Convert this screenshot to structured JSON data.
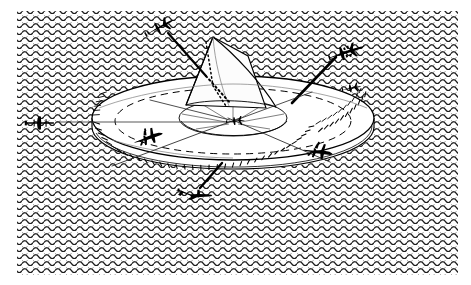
{
  "figure": {
    "kind": "technical-illustration",
    "width": 471,
    "height": 285,
    "background_style": "wavy-scalloped-hatch",
    "colors": {
      "paper": "#ffffff",
      "ink": "#000000",
      "hatch": "#2b2b2b",
      "hatch_tint": "#9a9a9a",
      "structure_fill": "#fdfdfd",
      "structure_light": "#f4f4f4"
    }
  },
  "frame": {
    "name": "hatched-background-panel",
    "x": 17,
    "y": 11,
    "width": 441,
    "height": 264,
    "pattern": "rows of scallop / wave marks"
  },
  "structure": {
    "name": "parabolic-dish-antenna",
    "parts": [
      {
        "id": "outer-rim-ellipse",
        "label": "Outer dish rim"
      },
      {
        "id": "dish-body-underside",
        "label": "Dish underside / torus body"
      },
      {
        "id": "rim-radial-ticks",
        "label": "Radial rib ticks along lower rim"
      },
      {
        "id": "inner-bowl-ellipse",
        "label": "Inner reflector bowl"
      },
      {
        "id": "inner-bowl-ribs",
        "label": "Inner bowl radial ribs"
      },
      {
        "id": "central-cone",
        "label": "Central feed cone / horn"
      },
      {
        "id": "dashed-horizon-ellipse",
        "label": "Dashed reference ellipse"
      },
      {
        "id": "cone-dotted-edge",
        "label": "Dotted cone edge line"
      }
    ],
    "center": {
      "x": 233,
      "y": 122
    }
  },
  "targets": [
    {
      "id": "aircraft-top-left",
      "label": "Aircraft — upper left bearing",
      "icon": "aircraft-top-view-icon",
      "x": 160,
      "y": 27,
      "rotation": -28,
      "scale": 1.0,
      "link": {
        "style": "solid-then-dotted",
        "to_x": 214,
        "to_y": 99
      }
    },
    {
      "id": "aircraft-upper-right",
      "label": "Aircraft — upper right bearing",
      "icon": "four-engine-bomber-icon",
      "x": 347,
      "y": 52,
      "rotation": -18,
      "scale": 1.1,
      "link": {
        "style": "solid-thick",
        "to_x": 290,
        "to_y": 103
      }
    },
    {
      "id": "aircraft-right-small",
      "label": "Aircraft — right flank",
      "icon": "small-aircraft-icon",
      "x": 352,
      "y": 88,
      "rotation": -10,
      "scale": 0.72,
      "link": null
    },
    {
      "id": "aircraft-left-head-on",
      "label": "Aircraft — left, head-on view",
      "icon": "aircraft-front-view-icon",
      "x": 42,
      "y": 123,
      "rotation": 0,
      "scale": 1.0,
      "link": {
        "style": "solid-thin",
        "to_x": 92,
        "to_y": 122
      }
    },
    {
      "id": "aircraft-rim-left",
      "label": "Aircraft — on left rim",
      "icon": "aircraft-silhouette-icon",
      "x": 148,
      "y": 137,
      "rotation": -14,
      "scale": 0.95,
      "link": null
    },
    {
      "id": "aircraft-rim-right",
      "label": "Aircraft — on right rim",
      "icon": "aircraft-silhouette-icon",
      "x": 318,
      "y": 151,
      "rotation": 12,
      "scale": 0.95,
      "link": null
    },
    {
      "id": "aircraft-center-bowl",
      "label": "Aircraft — at bowl centre",
      "icon": "small-aircraft-icon",
      "x": 236,
      "y": 121,
      "rotation": -6,
      "scale": 0.85,
      "link": null
    },
    {
      "id": "aircraft-bottom",
      "label": "Aircraft — lower bearing",
      "icon": "aircraft-banking-icon",
      "x": 195,
      "y": 196,
      "rotation": 14,
      "scale": 1.0,
      "link": {
        "style": "solid-thick",
        "to_x": 222,
        "to_y": 163
      }
    }
  ],
  "beams": [
    {
      "id": "beam-left",
      "label": "Beam axis to left target"
    },
    {
      "id": "beam-upper-right",
      "label": "Beam axis to upper right target"
    },
    {
      "id": "beam-lower-left",
      "label": "Beam axis to lower left"
    },
    {
      "id": "beam-lower-right",
      "label": "Beam axis to lower right"
    },
    {
      "id": "beam-top-left-dotted",
      "label": "Dotted beam axis to top left target"
    }
  ]
}
